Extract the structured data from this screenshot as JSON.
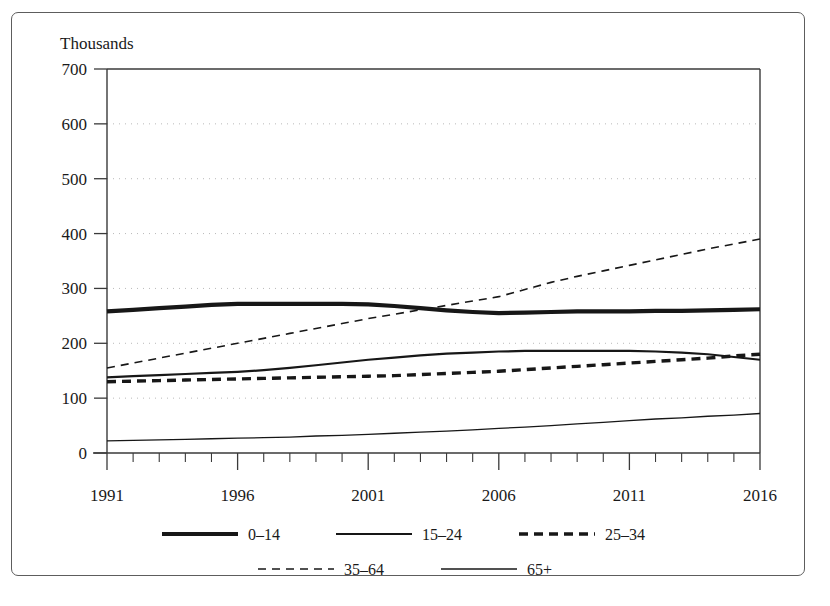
{
  "chart_data": {
    "type": "line",
    "title": "",
    "ylabel": "Thousands",
    "xlabel": "",
    "ylim": [
      0,
      700
    ],
    "ytick_step": 100,
    "yticks": [
      0,
      100,
      200,
      300,
      400,
      500,
      600,
      700
    ],
    "ytick_labels": [
      "0",
      "100",
      "200",
      "300",
      "400",
      "500",
      "600",
      "700"
    ],
    "xlim": [
      1991,
      2016
    ],
    "xticks": [
      1991,
      1996,
      2001,
      2006,
      2011,
      2016
    ],
    "xtick_labels": [
      "1991",
      "1996",
      "2001",
      "2006",
      "2011",
      "2016"
    ],
    "x_minor_step": 1,
    "grid": "horizontal-dotted",
    "legend_position": "bottom",
    "x": [
      1991,
      1992,
      1993,
      1994,
      1995,
      1996,
      1997,
      1998,
      1999,
      2000,
      2001,
      2002,
      2003,
      2004,
      2005,
      2006,
      2007,
      2008,
      2009,
      2010,
      2011,
      2012,
      2013,
      2014,
      2015,
      2016
    ],
    "series": [
      {
        "name": "0–14",
        "style": "solid-thick",
        "width": 4.2,
        "dash": "none",
        "color": "#171717",
        "values": [
          258,
          261,
          264,
          267,
          270,
          272,
          272,
          272,
          272,
          272,
          271,
          268,
          264,
          260,
          257,
          255,
          256,
          257,
          258,
          258,
          258,
          259,
          259,
          260,
          261,
          262
        ]
      },
      {
        "name": "15–24",
        "style": "solid-medium",
        "width": 2.2,
        "dash": "none",
        "color": "#171717",
        "values": [
          138,
          140,
          142,
          144,
          146,
          148,
          151,
          155,
          160,
          165,
          170,
          174,
          178,
          181,
          183,
          185,
          186,
          186,
          186,
          186,
          186,
          185,
          183,
          180,
          175,
          170
        ]
      },
      {
        "name": "25–34",
        "style": "dashed-thick",
        "width": 3.4,
        "dash": "9 6",
        "color": "#171717",
        "values": [
          130,
          131,
          132,
          133,
          134,
          135,
          136,
          137,
          138,
          139,
          140,
          141,
          143,
          145,
          147,
          149,
          152,
          155,
          158,
          161,
          164,
          167,
          170,
          173,
          177,
          180
        ]
      },
      {
        "name": "35–64",
        "style": "dashed-thin",
        "width": 1.6,
        "dash": "8 6",
        "color": "#171717",
        "values": [
          155,
          164,
          173,
          182,
          191,
          200,
          209,
          218,
          227,
          236,
          245,
          253,
          261,
          269,
          277,
          285,
          298,
          311,
          322,
          332,
          342,
          352,
          362,
          372,
          381,
          390
        ]
      },
      {
        "name": "65+",
        "style": "solid-thin",
        "width": 1.3,
        "dash": "none",
        "color": "#171717",
        "values": [
          22,
          23,
          24,
          25,
          26,
          27,
          28,
          29,
          31,
          32,
          34,
          36,
          38,
          40,
          42,
          45,
          47,
          50,
          53,
          56,
          59,
          62,
          64,
          67,
          69,
          72
        ]
      }
    ],
    "legend_rows": [
      [
        "0–14",
        "15–24",
        "25–34"
      ],
      [
        "35–64",
        "65+"
      ]
    ]
  }
}
